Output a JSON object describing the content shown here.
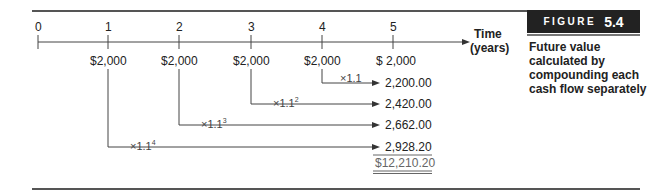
{
  "figure": {
    "label_word": "FIGURE",
    "label_number": "5.4",
    "caption": "Future value calculated by compounding each cash flow separately"
  },
  "timeline": {
    "ticks": [
      "0",
      "1",
      "2",
      "3",
      "4",
      "5"
    ],
    "axis_label_line1": "Time",
    "axis_label_line2": "(years)",
    "cash_flows": [
      "$2,000",
      "$2,000",
      "$2,000",
      "$2,000",
      "$ 2,000"
    ]
  },
  "compounding": [
    {
      "multiplier": "×1.1",
      "exponent": "",
      "future_value": "2,200.00"
    },
    {
      "multiplier": "×1.1",
      "exponent": "2",
      "future_value": "2,420.00"
    },
    {
      "multiplier": "×1.1",
      "exponent": "3",
      "future_value": "2,662.00"
    },
    {
      "multiplier": "×1.1",
      "exponent": "4",
      "future_value": "2,928.20"
    }
  ],
  "total": "$12,210.20"
}
